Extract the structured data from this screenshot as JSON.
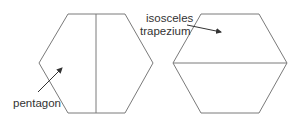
{
  "diagram": {
    "left_shape": {
      "type": "hexagon",
      "divider": "vertical",
      "label": "pentagon"
    },
    "right_shape": {
      "type": "hexagon",
      "divider": "horizontal",
      "label_line1": "isosceles",
      "label_line2": "trapezium"
    },
    "colors": {
      "line": "#7a7a7a",
      "text": "#333333"
    }
  }
}
